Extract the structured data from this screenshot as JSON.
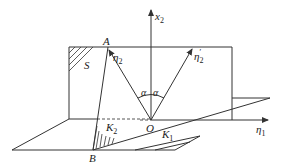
{
  "diagram": {
    "labels": {
      "x2_axis": "x",
      "x2_sub": "2",
      "eta1_axis": "η",
      "eta1_sub": "1",
      "eta2": "η",
      "eta2_sub": "2",
      "eta2_prime": "η",
      "eta2_prime_sub": "2",
      "eta2_prime_mark": "′",
      "point_A": "A",
      "point_B": "B",
      "point_O": "O",
      "region_S": "S",
      "region_K1": "K",
      "region_K1_sub": "1",
      "region_K2": "K",
      "region_K2_sub": "2",
      "angle_left": "α",
      "angle_right": "α"
    },
    "colors": {
      "line": "#333333",
      "background": "#ffffff"
    }
  }
}
